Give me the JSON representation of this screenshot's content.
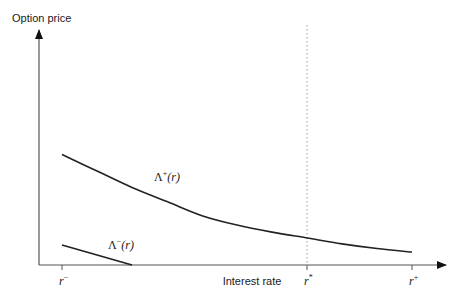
{
  "chart_data": {
    "type": "line",
    "title": "",
    "ylabel": "Option price",
    "xlabel": "Interest rate",
    "x_ticks": [
      {
        "name": "r_minus",
        "base": "r",
        "sup": "−"
      },
      {
        "name": "r_star",
        "base": "r",
        "sup": "*"
      },
      {
        "name": "r_plus",
        "base": "r",
        "sup": "+"
      }
    ],
    "xlim": [
      0,
      1
    ],
    "ylim": [
      0,
      1
    ],
    "x_positions": {
      "r_minus": 0.0,
      "r_star": 0.7,
      "r_plus": 1.0
    },
    "series": [
      {
        "name": "Lambda_plus",
        "label": {
          "base": "Λ",
          "sup": "+",
          "arg": "(r)"
        },
        "points": [
          [
            0.0,
            0.47
          ],
          [
            0.1,
            0.4
          ],
          [
            0.2,
            0.33
          ],
          [
            0.3,
            0.27
          ],
          [
            0.4,
            0.21
          ],
          [
            0.5,
            0.17
          ],
          [
            0.6,
            0.14
          ],
          [
            0.7,
            0.115
          ],
          [
            0.8,
            0.09
          ],
          [
            0.9,
            0.07
          ],
          [
            1.0,
            0.055
          ]
        ]
      },
      {
        "name": "Lambda_minus",
        "label": {
          "base": "Λ",
          "sup": "−",
          "arg": "(r)"
        },
        "points": [
          [
            0.0,
            0.085
          ],
          [
            0.2,
            0.0
          ]
        ]
      }
    ],
    "reference_lines": [
      {
        "name": "r_star_line",
        "x": 0.7,
        "style": "dotted"
      }
    ],
    "grid": false,
    "legend": "none"
  }
}
